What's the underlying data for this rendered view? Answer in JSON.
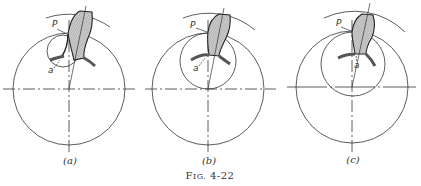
{
  "figure": {
    "caption_prefix": "F",
    "caption_small": "IG.",
    "caption_number": " 4-22",
    "panels": [
      {
        "id": "a",
        "label": "(a)",
        "point_P": "P",
        "point_a": "a",
        "gear_center": [
          69,
          89
        ],
        "gear_radius": 56,
        "mating_circle_center": [
          63,
          51
        ],
        "mating_circle_radius": 16
      },
      {
        "id": "b",
        "label": "(b)",
        "point_P": "P",
        "point_a": "a",
        "gear_center": [
          208,
          89
        ],
        "gear_radius": 56,
        "mating_circle_center": [
          208,
          61
        ],
        "mating_circle_radius": 28
      },
      {
        "id": "c",
        "label": "(c)",
        "point_P": "P",
        "point_a": "a",
        "gear_center": [
          352,
          87
        ],
        "gear_radius": 56,
        "mating_circle_center": [
          353,
          64
        ],
        "mating_circle_radius": 32
      }
    ]
  }
}
